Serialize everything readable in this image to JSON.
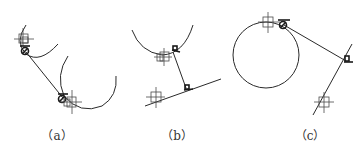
{
  "figure": {
    "panels": [
      {
        "id": "a",
        "caption": "（a）",
        "caption_x": 57,
        "elements": [
          "two tangent arcs",
          "connecting tangent line",
          "crosshair center markers",
          "tangent point markers"
        ]
      },
      {
        "id": "b",
        "caption": "（b）",
        "caption_x": 177,
        "elements": [
          "arc",
          "straight line",
          "perpendicular segment",
          "crosshair center markers",
          "perpendicular markers"
        ]
      },
      {
        "id": "c",
        "caption": "（c）",
        "caption_x": 310,
        "elements": [
          "full circle",
          "straight line",
          "tangent segment",
          "crosshair center markers",
          "tangent and perpendicular markers"
        ]
      }
    ],
    "colors": {
      "line": "#2a2a2a",
      "background": "#ffffff"
    },
    "icons": {
      "crosshair": "crosshair-square-icon",
      "tangent": "tangent-circle-icon",
      "perpendicular": "perpendicular-icon"
    }
  }
}
